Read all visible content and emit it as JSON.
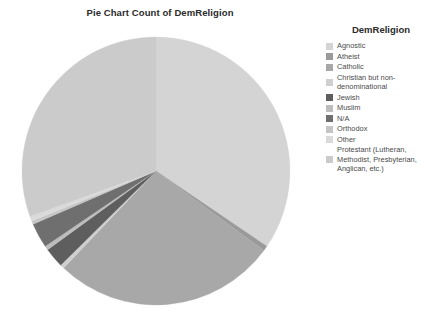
{
  "chart": {
    "title": "Pie Chart Count of DemReligion"
  },
  "legend": {
    "title": "DemReligion"
  },
  "chart_data": {
    "type": "pie",
    "title": "Pie Chart Count of DemReligion",
    "legend_title": "DemReligion",
    "legend_position": "right",
    "start_angle_deg": 0,
    "direction": "clockwise",
    "center": [
      156,
      171
    ],
    "radius": 134,
    "labels": [
      "Agnostic",
      "Atheist",
      "Catholic",
      "Christian but non-denominational",
      "Jewish",
      "Muslim",
      "N/A",
      "Orthodox",
      "Other",
      "Protestant (Lutheran, Methodist, Presbyterian, Anglican, etc.)"
    ],
    "values": [
      34.5,
      0.6,
      27.0,
      0.5,
      2.4,
      0.5,
      3.0,
      0.4,
      0.6,
      30.5
    ],
    "colors": [
      "#d4d4d4",
      "#9a9a9a",
      "#a8a8a8",
      "#cfcfcf",
      "#5e5e5e",
      "#bdbdbd",
      "#6f6f6f",
      "#c6c6c6",
      "#dadada",
      "#cbcbcb"
    ]
  }
}
